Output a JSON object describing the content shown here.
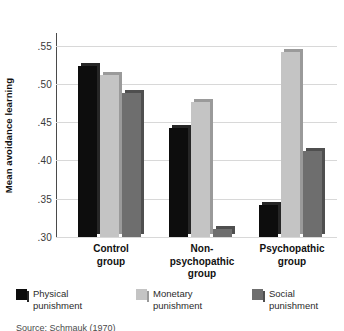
{
  "chart_data": {
    "type": "bar",
    "title": "",
    "xlabel": "",
    "ylabel": "Mean avoidance learning",
    "ylim": [
      0.3,
      0.5665
    ],
    "yticks": [
      ".30",
      ".35",
      ".40",
      ".45",
      ".50",
      ".55"
    ],
    "ytick_values": [
      0.3,
      0.35,
      0.4,
      0.45,
      0.5,
      0.55
    ],
    "grid": true,
    "legend_position": "bottom",
    "categories": [
      "Control\ngroup",
      "Non-\npsychopathic\ngroup",
      "Psychopathic\ngroup"
    ],
    "series": [
      {
        "name": "Physical punishment",
        "color": "#0d0d0d",
        "side_color": "#262626",
        "values": [
          0.524,
          0.442,
          0.342
        ]
      },
      {
        "name": "Monetary punishment",
        "color": "#c4c4c4",
        "side_color": "#9a9a9a",
        "values": [
          0.511,
          0.476,
          0.542
        ]
      },
      {
        "name": "Social punishment",
        "color": "#6e6e6e",
        "side_color": "#4f4f4f",
        "values": [
          0.488,
          0.311,
          0.412
        ]
      }
    ]
  },
  "axis": {
    "y_title": "Mean avoidance learning",
    "ticks": {
      "t0": ".30",
      "t1": ".35",
      "t2": ".40",
      "t3": ".45",
      "t4": ".50",
      "t5": ".55"
    }
  },
  "categories": {
    "c0_line1": "Control",
    "c0_line2": "group",
    "c1_line1": "Non-",
    "c1_line2": "psychopathic",
    "c1_line3": "group",
    "c2_line1": "Psychopathic",
    "c2_line2": "group"
  },
  "legend": {
    "items": [
      {
        "label": "Physical\npunishment",
        "color": "#0d0d0d"
      },
      {
        "label": "Monetary\npunishment",
        "color": "#c4c4c4"
      },
      {
        "label": "Social\npunishment",
        "color": "#6e6e6e"
      }
    ]
  },
  "caption": {
    "source": "Source: Schmauk (1970)"
  },
  "colors": {
    "physical": "#0d0d0d",
    "monetary": "#c4c4c4",
    "social": "#6e6e6e",
    "gridline": "#d8d8d8",
    "axis": "#4a4a4a",
    "background": "#ffffff"
  }
}
